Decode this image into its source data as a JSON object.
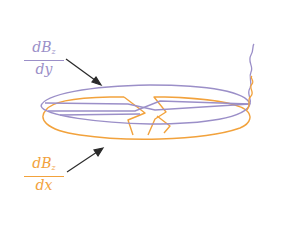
{
  "colors": {
    "purple": "#9b8fc8",
    "orange": "#f2a23c",
    "arrow": "#2a2a2a",
    "background": "#ffffff"
  },
  "labels": {
    "dy": {
      "numerator_base": "dB",
      "numerator_sub": "z",
      "denominator": "dy",
      "color_key": "purple"
    },
    "dx": {
      "numerator_base": "dB",
      "numerator_sub": "z",
      "denominator": "dx",
      "color_key": "orange"
    }
  },
  "shapes": [
    {
      "name": "purple-disk-outline",
      "series": "dB_z/dy",
      "color": "#9b8fc8"
    },
    {
      "name": "orange-disk-outline",
      "series": "dB_z/dx",
      "color": "#f2a23c"
    },
    {
      "name": "purple-wavy-lead",
      "series": "dB_z/dy",
      "color": "#9b8fc8"
    },
    {
      "name": "orange-wavy-lead",
      "series": "dB_z/dx",
      "color": "#f2a23c"
    }
  ]
}
